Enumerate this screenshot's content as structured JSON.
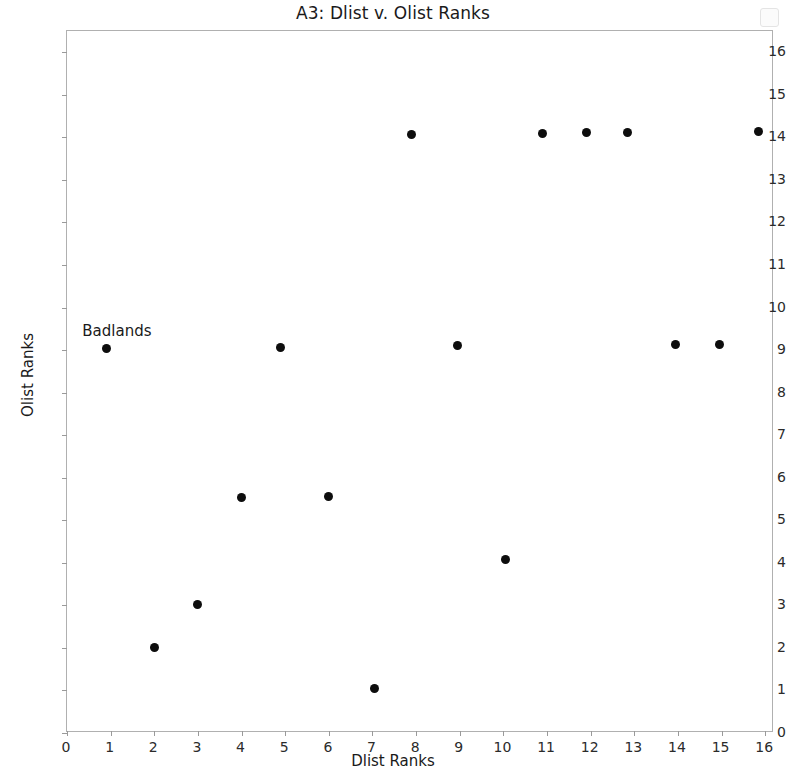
{
  "chart_data": {
    "type": "scatter",
    "title": "A3: Dlist v. Olist Ranks",
    "xlabel": "Dlist Ranks",
    "ylabel": "Olist Ranks",
    "xlim": [
      0,
      16.2
    ],
    "ylim": [
      0,
      16.5
    ],
    "xticks": [
      0,
      1,
      2,
      3,
      4,
      5,
      6,
      7,
      8,
      9,
      10,
      11,
      12,
      13,
      14,
      15,
      16
    ],
    "yticks": [
      0,
      1,
      2,
      3,
      4,
      5,
      6,
      7,
      8,
      9,
      10,
      11,
      12,
      13,
      14,
      15,
      16
    ],
    "xtick_labels": [
      "0",
      "1",
      "2",
      "3",
      "4",
      "5",
      "6",
      "7",
      "8",
      "9",
      "10",
      "11",
      "12",
      "13",
      "14",
      "15",
      "16"
    ],
    "ytick_labels": [
      "0",
      "1",
      "2",
      "3",
      "4",
      "5",
      "6",
      "7",
      "8",
      "9",
      "10",
      "11",
      "12",
      "13",
      "14",
      "15",
      "16"
    ],
    "grid": false,
    "legend": "none",
    "marker_color": "#0d0d0d",
    "marker_shape": "circle",
    "points": [
      {
        "x": 0.9,
        "y": 9.03
      },
      {
        "x": 2.0,
        "y": 2.02
      },
      {
        "x": 3.0,
        "y": 3.03
      },
      {
        "x": 4.0,
        "y": 5.54
      },
      {
        "x": 4.9,
        "y": 9.05
      },
      {
        "x": 6.0,
        "y": 5.55
      },
      {
        "x": 7.05,
        "y": 1.05
      },
      {
        "x": 7.9,
        "y": 14.06
      },
      {
        "x": 8.95,
        "y": 9.1
      },
      {
        "x": 10.05,
        "y": 4.08
      },
      {
        "x": 10.9,
        "y": 14.1
      },
      {
        "x": 11.9,
        "y": 14.11
      },
      {
        "x": 12.85,
        "y": 14.12
      },
      {
        "x": 13.95,
        "y": 9.13
      },
      {
        "x": 14.95,
        "y": 9.14
      },
      {
        "x": 15.85,
        "y": 14.13
      }
    ],
    "annotations": [
      {
        "text": "Badlands",
        "x": 0.35,
        "y": 9.65
      }
    ]
  }
}
